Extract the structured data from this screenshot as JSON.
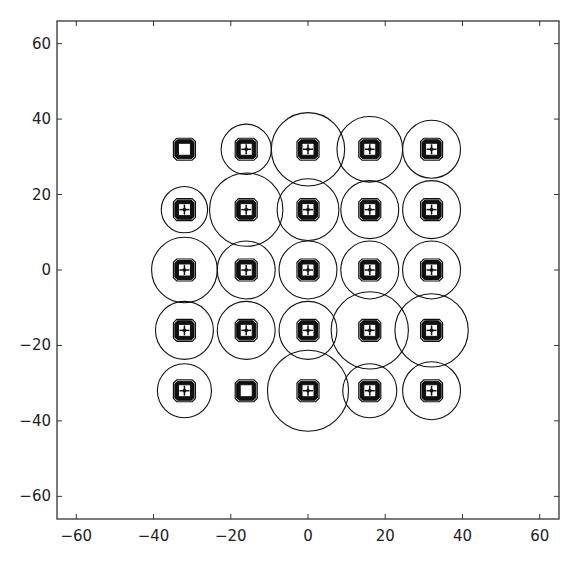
{
  "chart_data": {
    "type": "scatter",
    "title": "",
    "xlabel": "",
    "ylabel": "",
    "xlim": [
      -65,
      65
    ],
    "ylim": [
      -66,
      66
    ],
    "xticks": [
      -60,
      -40,
      -20,
      0,
      20,
      40,
      60
    ],
    "yticks": [
      -60,
      -40,
      -20,
      0,
      20,
      40,
      60
    ],
    "grid": false,
    "legend": null,
    "colors": {
      "line": "#111111",
      "axes": "#333333",
      "background": "#ffffff"
    },
    "points": [
      {
        "x": -32,
        "y": 32,
        "r": 0
      },
      {
        "x": -16,
        "y": 32,
        "r": 6.5
      },
      {
        "x": 0,
        "y": 32,
        "r": 9.5
      },
      {
        "x": 16,
        "y": 32,
        "r": 8.5
      },
      {
        "x": 32,
        "y": 32,
        "r": 7.5
      },
      {
        "x": -32,
        "y": 16,
        "r": 6.0
      },
      {
        "x": -16,
        "y": 16,
        "r": 9.5
      },
      {
        "x": 0,
        "y": 16,
        "r": 8.0
      },
      {
        "x": 16,
        "y": 16,
        "r": 7.5
      },
      {
        "x": 32,
        "y": 16,
        "r": 7.5
      },
      {
        "x": -32,
        "y": 0,
        "r": 8.5
      },
      {
        "x": -16,
        "y": 0,
        "r": 7.5
      },
      {
        "x": 0,
        "y": 0,
        "r": 7.5
      },
      {
        "x": 16,
        "y": 0,
        "r": 7.5
      },
      {
        "x": 32,
        "y": 0,
        "r": 7.5
      },
      {
        "x": -32,
        "y": -16,
        "r": 7.5
      },
      {
        "x": -16,
        "y": -16,
        "r": 7.5
      },
      {
        "x": 0,
        "y": -16,
        "r": 7.5
      },
      {
        "x": 16,
        "y": -16,
        "r": 10.0
      },
      {
        "x": 32,
        "y": -16,
        "r": 9.5
      },
      {
        "x": -32,
        "y": -32,
        "r": 7.0
      },
      {
        "x": -16,
        "y": -32,
        "r": 0
      },
      {
        "x": 0,
        "y": -32,
        "r": 10.5
      },
      {
        "x": 16,
        "y": -32,
        "r": 7.0
      },
      {
        "x": 32,
        "y": -32,
        "r": 7.5
      }
    ]
  }
}
